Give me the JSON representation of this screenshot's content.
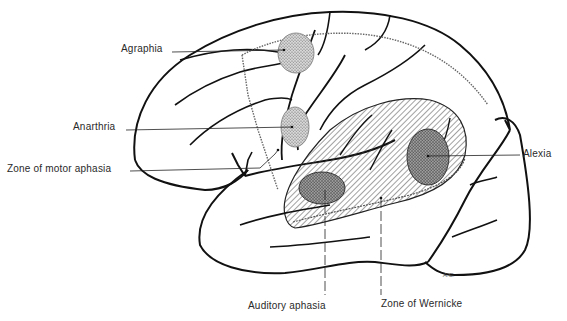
{
  "figure": {
    "labels": {
      "agraphia": "Agraphia",
      "anarthria": "Anarthria",
      "motor_aphasia": "Zone of motor aphasia",
      "alexia": "Alexia",
      "auditory_aphasia": "Auditory aphasia",
      "wernicke": "Zone of Wernicke"
    },
    "signature": "A.C."
  },
  "colors": {
    "line": "#111111",
    "stipple": "#9a9a9a",
    "hatch": "#555555",
    "background": "#ffffff"
  }
}
